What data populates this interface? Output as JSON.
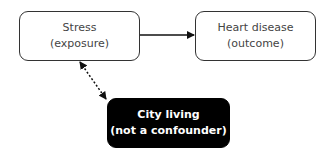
{
  "nodes": {
    "stress": {
      "title": "Stress",
      "subtitle": "(exposure)",
      "fill": "#ffffff",
      "text_color": "#444444"
    },
    "heart": {
      "title": "Heart disease",
      "subtitle": "(outcome)",
      "fill": "#ffffff",
      "text_color": "#444444"
    },
    "city": {
      "title": "City living",
      "subtitle": "(not a confounder)",
      "fill": "#000000",
      "text_color": "#ffffff"
    }
  },
  "edges": [
    {
      "from": "stress",
      "to": "heart",
      "style": "solid",
      "direction": "forward"
    },
    {
      "from": "stress",
      "to": "city",
      "style": "dotted",
      "direction": "both"
    }
  ]
}
